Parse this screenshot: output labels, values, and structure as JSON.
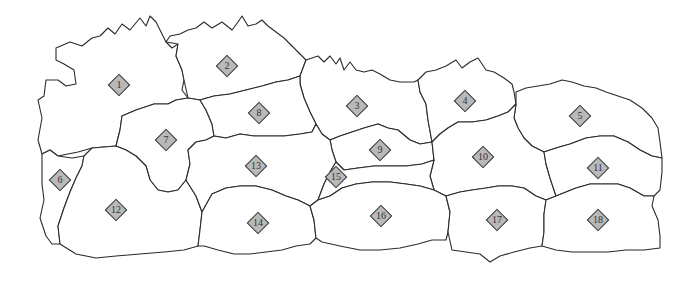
{
  "map": {
    "type": "region-map",
    "colors": {
      "background": "#ffffff",
      "region_fill": "#ffffff",
      "border": "#2b2b2b",
      "marker_fill": "#b9b9b9",
      "marker_border": "#3a3a3a",
      "label_text": "#333333"
    },
    "regions": [
      {
        "id": "1",
        "label": "1",
        "x": 119,
        "y": 85
      },
      {
        "id": "2",
        "label": "2",
        "x": 227,
        "y": 66
      },
      {
        "id": "3",
        "label": "3",
        "x": 357,
        "y": 106
      },
      {
        "id": "4",
        "label": "4",
        "x": 465,
        "y": 101
      },
      {
        "id": "5",
        "label": "5",
        "x": 580,
        "y": 116
      },
      {
        "id": "6",
        "label": "6",
        "x": 60,
        "y": 180
      },
      {
        "id": "7",
        "label": "7",
        "x": 166,
        "y": 140
      },
      {
        "id": "8",
        "label": "8",
        "x": 259,
        "y": 113
      },
      {
        "id": "9",
        "label": "9",
        "x": 380,
        "y": 150
      },
      {
        "id": "10",
        "label": "10",
        "x": 483,
        "y": 157
      },
      {
        "id": "11",
        "label": "11",
        "x": 598,
        "y": 168
      },
      {
        "id": "12",
        "label": "12",
        "x": 116,
        "y": 210
      },
      {
        "id": "13",
        "label": "13",
        "x": 256,
        "y": 166
      },
      {
        "id": "14",
        "label": "14",
        "x": 258,
        "y": 223
      },
      {
        "id": "15",
        "label": "15",
        "x": 336,
        "y": 177
      },
      {
        "id": "16",
        "label": "16",
        "x": 381,
        "y": 216
      },
      {
        "id": "17",
        "label": "17",
        "x": 497,
        "y": 220
      },
      {
        "id": "18",
        "label": "18",
        "x": 598,
        "y": 220
      }
    ]
  }
}
